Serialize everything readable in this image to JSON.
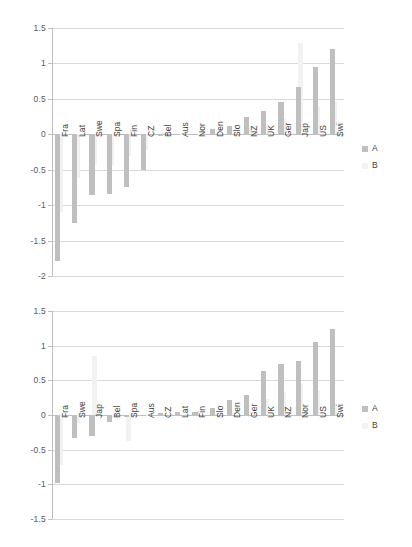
{
  "chart_data": [
    {
      "id": "top",
      "type": "bar",
      "title": "",
      "xlabel": "",
      "ylabel": "",
      "ylim": [
        -2,
        1.5
      ],
      "yticks": [
        1.5,
        1,
        0.5,
        0,
        -0.5,
        -1,
        -1.5,
        -2
      ],
      "ytick_labels": [
        "1.5",
        "1",
        "0.5",
        "0",
        "-0.5",
        "-1",
        "-1.5",
        "-2"
      ],
      "grid": true,
      "legend_position": "right",
      "categories": [
        "Fra",
        "Lat",
        "Swe",
        "Spa",
        "Fin",
        "CZ",
        "Bel",
        "Aus",
        "Nor",
        "Den",
        "Slo",
        "NZ",
        "UK",
        "Ger",
        "Jap",
        "US",
        "Swi"
      ],
      "series": [
        {
          "name": "A",
          "color": "#bfbfbf",
          "values": [
            -1.79,
            -1.25,
            -0.85,
            -0.84,
            -0.74,
            -0.51,
            -0.02,
            -0.01,
            0.0,
            0.07,
            0.11,
            0.24,
            0.33,
            0.45,
            0.67,
            0.95,
            1.2
          ]
        },
        {
          "name": "B",
          "color": "#f2f2f2",
          "values": [
            -1.1,
            -0.62,
            -0.44,
            -0.43,
            -0.3,
            -0.22,
            0.02,
            0.0,
            0.0,
            0.02,
            0.05,
            0.09,
            0.14,
            0.22,
            1.29,
            0.38,
            0.46
          ]
        }
      ]
    },
    {
      "id": "bottom",
      "type": "bar",
      "title": "",
      "xlabel": "",
      "ylabel": "",
      "ylim": [
        -1.5,
        1.5
      ],
      "yticks": [
        1.5,
        1,
        0.5,
        0,
        -0.5,
        -1,
        -1.5
      ],
      "ytick_labels": [
        "1.5",
        "1",
        "0.5",
        "0",
        "-0.5",
        "-1",
        "-1.5"
      ],
      "grid": true,
      "legend_position": "right",
      "categories": [
        "Fra",
        "Swe",
        "Jap",
        "Bel",
        "Spa",
        "Aus",
        "CZ",
        "Lat",
        "Fin",
        "Slo",
        "Den",
        "Ger",
        "UK",
        "NZ",
        "Nor",
        "US",
        "Swi"
      ],
      "series": [
        {
          "name": "A",
          "color": "#bfbfbf",
          "values": [
            -0.98,
            -0.33,
            -0.31,
            -0.1,
            -0.03,
            -0.01,
            0.03,
            0.04,
            0.05,
            0.1,
            0.22,
            0.29,
            0.63,
            0.74,
            0.78,
            1.06,
            1.24
          ]
        },
        {
          "name": "B",
          "color": "#f2f2f2",
          "values": [
            -0.72,
            -0.12,
            0.85,
            -0.05,
            -0.38,
            0.0,
            0.01,
            0.01,
            0.01,
            0.02,
            0.04,
            0.06,
            0.23,
            0.33,
            0.44,
            0.35,
            0.17
          ]
        }
      ]
    }
  ],
  "legend": {
    "series_a_label": "A",
    "series_b_label": "B"
  },
  "colors": {
    "series_a": "#bfbfbf",
    "series_b": "#f2f2f2",
    "gridline": "#d9d9d9",
    "axis": "#bfbfbf",
    "text": "#3f3f3f",
    "background": "#ffffff"
  }
}
